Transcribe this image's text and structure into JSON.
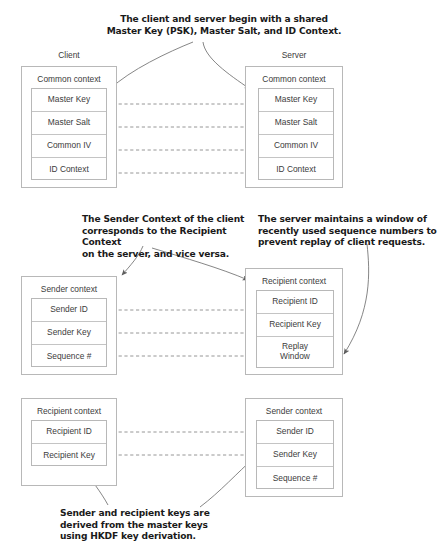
{
  "diagram": {
    "type": "security-context-diagram"
  },
  "callouts": [
    {
      "id": "callout-shared-material",
      "text": "The client and server begin with a shared\nMaster Key (PSK), Master Salt, and ID Context.",
      "align": "center",
      "x": 84,
      "y": 14,
      "width": 280
    },
    {
      "id": "callout-sender-recipient-correspondence",
      "text": "The Sender Context of the client\ncorresponds to the Recipient Context\non the server, and vice versa.",
      "align": "left",
      "x": 82,
      "y": 214,
      "width": 175
    },
    {
      "id": "callout-replay-window",
      "text": "The server maintains a window of\nrecently used sequence numbers to\nprevent replay of client requests.",
      "align": "left",
      "x": 258,
      "y": 214,
      "width": 182
    },
    {
      "id": "callout-key-derivation",
      "text": "Sender and recipient keys are\nderived from the master keys\nusing HKDF key derivation.",
      "align": "left",
      "x": 60,
      "y": 508,
      "width": 175
    }
  ],
  "groups": [
    {
      "id": "group-client",
      "label": "Client",
      "x": 21,
      "y": 50,
      "width": 96
    },
    {
      "id": "group-server",
      "label": "Server",
      "x": 245,
      "y": 50,
      "width": 98
    }
  ],
  "contexts": [
    {
      "id": "client-common-context",
      "role": "client",
      "title": "Common context",
      "box": {
        "x": 21,
        "y": 66,
        "width": 96,
        "height": 122
      },
      "stack": {
        "x": 31,
        "y": 88,
        "width": 76,
        "height": 92
      },
      "rows": [
        "Master Key",
        "Master Salt",
        "Common IV",
        "ID Context"
      ]
    },
    {
      "id": "server-common-context",
      "role": "server",
      "title": "Common context",
      "box": {
        "x": 245,
        "y": 66,
        "width": 98,
        "height": 122
      },
      "stack": {
        "x": 258,
        "y": 88,
        "width": 76,
        "height": 92
      },
      "rows": [
        "Master Key",
        "Master Salt",
        "Common IV",
        "ID Context"
      ]
    },
    {
      "id": "client-sender-context",
      "role": "client",
      "title": "Sender context",
      "box": {
        "x": 21,
        "y": 276,
        "width": 96,
        "height": 99
      },
      "stack": {
        "x": 31,
        "y": 298,
        "width": 76,
        "height": 69
      },
      "rows": [
        "Sender ID",
        "Sender Key",
        "Sequence #"
      ]
    },
    {
      "id": "server-recipient-context",
      "role": "server",
      "title": "Recipient context",
      "box": {
        "x": 245,
        "y": 268,
        "width": 98,
        "height": 107
      },
      "stack": {
        "x": 256,
        "y": 290,
        "width": 78,
        "height": 78
      },
      "rows": [
        "Recipient ID",
        "Recipient Key",
        "Replay\nWindow"
      ]
    },
    {
      "id": "client-recipient-context",
      "role": "client",
      "title": "Recipient context",
      "box": {
        "x": 21,
        "y": 398,
        "width": 96,
        "height": 88
      },
      "stack": {
        "x": 31,
        "y": 420,
        "width": 76,
        "height": 46
      },
      "rows": [
        "Recipient ID",
        "Recipient Key"
      ]
    },
    {
      "id": "server-sender-context",
      "role": "server",
      "title": "Sender context",
      "box": {
        "x": 245,
        "y": 398,
        "width": 98,
        "height": 99
      },
      "stack": {
        "x": 256,
        "y": 420,
        "width": 78,
        "height": 69
      },
      "rows": [
        "Sender ID",
        "Sender Key",
        "Sequence #"
      ]
    }
  ],
  "connectors": {
    "dashed_links": [
      {
        "id": "link-master-key",
        "from": "client-common-context.Master Key",
        "to": "server-common-context.Master Key",
        "x1": 107,
        "y1": 104,
        "x2": 258,
        "y2": 104
      },
      {
        "id": "link-master-salt",
        "from": "client-common-context.Master Salt",
        "to": "server-common-context.Master Salt",
        "x1": 107,
        "y1": 127,
        "x2": 258,
        "y2": 127
      },
      {
        "id": "link-common-iv",
        "from": "client-common-context.Common IV",
        "to": "server-common-context.Common IV",
        "x1": 107,
        "y1": 150,
        "x2": 258,
        "y2": 150
      },
      {
        "id": "link-id-context",
        "from": "client-common-context.ID Context",
        "to": "server-common-context.ID Context",
        "x1": 107,
        "y1": 173,
        "x2": 258,
        "y2": 173
      },
      {
        "id": "link-sender-id",
        "from": "client-sender-context.Sender ID",
        "to": "server-recipient-context.Recipient ID",
        "x1": 107,
        "y1": 310,
        "x2": 256,
        "y2": 310
      },
      {
        "id": "link-sender-key",
        "from": "client-sender-context.Sender Key",
        "to": "server-recipient-context.Recipient Key",
        "x1": 107,
        "y1": 333,
        "x2": 256,
        "y2": 333
      },
      {
        "id": "link-sequence",
        "from": "client-sender-context.Sequence #",
        "to": "server-recipient-context.Replay Window",
        "x1": 107,
        "y1": 356,
        "x2": 256,
        "y2": 356
      },
      {
        "id": "link-recipient-id",
        "from": "client-recipient-context.Recipient ID",
        "to": "server-sender-context.Sender ID",
        "x1": 107,
        "y1": 432,
        "x2": 256,
        "y2": 432
      },
      {
        "id": "link-recipient-key",
        "from": "client-recipient-context.Recipient Key",
        "to": "server-sender-context.Sender Key",
        "x1": 107,
        "y1": 455,
        "x2": 256,
        "y2": 455
      }
    ],
    "arrows": [
      {
        "id": "arrow-shared-to-client",
        "target": "client-common-context.Master Key"
      },
      {
        "id": "arrow-shared-to-server",
        "target": "server-common-context.Master Key"
      },
      {
        "id": "arrow-correspondence-to-sender",
        "target": "client-sender-context"
      },
      {
        "id": "arrow-correspondence-to-recipient",
        "target": "server-recipient-context"
      },
      {
        "id": "arrow-replay-to-window",
        "target": "server-recipient-context.Replay Window"
      },
      {
        "id": "arrow-derivation-to-recipient-key",
        "target": "client-recipient-context.Recipient Key"
      },
      {
        "id": "arrow-derivation-to-sender-key",
        "target": "server-sender-context.Sender Key"
      }
    ]
  },
  "colors": {
    "background": "#ffffff",
    "box_border": "#b8b8b8",
    "row_border": "#c4c4c4",
    "body_text": "#3c3c3c",
    "callout_text": "#1a1a1a",
    "connector": "#8a8a8a",
    "arrow": "#707070"
  }
}
